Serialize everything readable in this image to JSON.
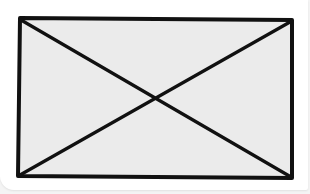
{
  "placeholder": {
    "kind": "image-placeholder",
    "icon": "crossed-box-icon",
    "fill_color": "#ebebeb",
    "stroke_color": "#111111",
    "background_color": "#ffffff"
  }
}
